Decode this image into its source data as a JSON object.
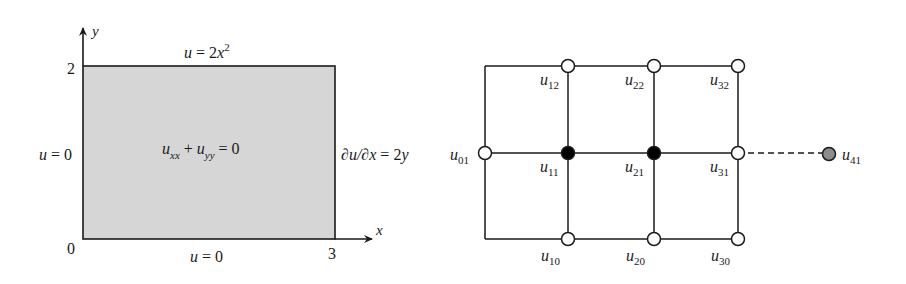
{
  "left_panel": {
    "axes": {
      "x_label": "x",
      "y_label": "y",
      "origin": "0",
      "x_max": "3",
      "y_max": "2"
    },
    "domain_fill": "#d6d6d6",
    "pde": {
      "u": "u",
      "sub1": "xx",
      "plus": "+",
      "sub2": "yy",
      "rhs": "= 0"
    },
    "bc_top": {
      "lhs": "u",
      "eq": " = 2",
      "var": "x",
      "sup": "2"
    },
    "bc_bottom": {
      "lhs": "u",
      "eq": " = 0"
    },
    "bc_left": {
      "lhs": "u",
      "eq": " = 0"
    },
    "bc_right": {
      "text": "∂u/∂x",
      "eq": " = 2",
      "var": "y"
    }
  },
  "right_panel": {
    "nodes": [
      {
        "label": "u",
        "sub": "01",
        "type": "boundary-known"
      },
      {
        "label": "u",
        "sub": "10",
        "type": "boundary-known"
      },
      {
        "label": "u",
        "sub": "11",
        "type": "unknown-interior"
      },
      {
        "label": "u",
        "sub": "12",
        "type": "boundary-known"
      },
      {
        "label": "u",
        "sub": "20",
        "type": "boundary-known"
      },
      {
        "label": "u",
        "sub": "21",
        "type": "unknown-interior"
      },
      {
        "label": "u",
        "sub": "22",
        "type": "boundary-known"
      },
      {
        "label": "u",
        "sub": "30",
        "type": "boundary-known"
      },
      {
        "label": "u",
        "sub": "31",
        "type": "boundary-neumann"
      },
      {
        "label": "u",
        "sub": "32",
        "type": "boundary-known"
      },
      {
        "label": "u",
        "sub": "41",
        "type": "ghost"
      }
    ],
    "colors": {
      "open": "#ffffff",
      "filled": "#000000",
      "ghost": "#8c8c8c"
    }
  }
}
